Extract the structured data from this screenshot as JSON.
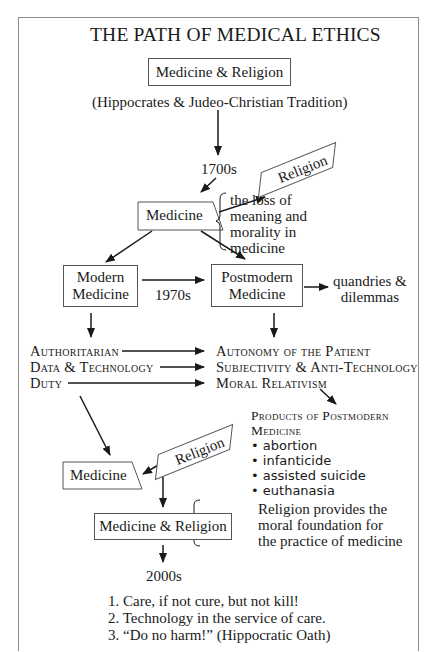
{
  "title": "THE PATH OF MEDICAL ETHICS",
  "nodes": {
    "top_box": "Medicine & Religion",
    "tradition": "(Hippocrates & Judeo-Christian Tradition)",
    "era_1700s": "1700s",
    "religion_upper": "Religion",
    "medicine_upper": "Medicine",
    "loss_note": [
      "the loss of",
      "meaning and",
      "morality in",
      "medicine"
    ],
    "modern_medicine": [
      "Modern",
      "Medicine"
    ],
    "era_1970s": "1970s",
    "postmodern_medicine": [
      "Postmodern",
      "Medicine"
    ],
    "quandries": [
      "quandries &",
      "dilemmas"
    ],
    "modern_traits": [
      "Authoritarian",
      "Data & Technology",
      "Duty"
    ],
    "postmodern_traits": [
      "Autonomy of the Patient",
      "Subjectivity & Anti-Technology",
      "Moral Relativism"
    ],
    "products_heading": [
      "Products of Postmodern",
      "Medicine"
    ],
    "products": [
      "abortion",
      "infanticide",
      "assisted suicide",
      "euthanasia"
    ],
    "religion_lower": "Religion",
    "medicine_lower": "Medicine",
    "bottom_box": "Medicine & Religion",
    "foundation_note": [
      "Religion provides the",
      "moral foundation for",
      "the practice of medicine"
    ],
    "era_2000s": "2000s",
    "principles": [
      "1. Care, if not cure, but not kill!",
      "2. Technology in the service of care.",
      "3. “Do no harm!” (Hippocratic Oath)"
    ]
  },
  "colors": {
    "stroke": "#1a1a1a",
    "frame": "#8c8c8c",
    "text": "#1a1a1a"
  }
}
